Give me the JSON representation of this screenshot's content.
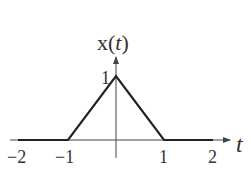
{
  "title": "x(t)",
  "title_parts": {
    "prefix": "x(",
    "var": "t",
    "suffix": ")"
  },
  "x_axis_label": "t",
  "x_ticks": [
    "−2",
    "−1",
    "1",
    "2"
  ],
  "y_ticks": [
    "1"
  ],
  "signal": {
    "description": "triangular pulse",
    "points": [
      [
        -2,
        0
      ],
      [
        -1,
        0
      ],
      [
        0,
        1
      ],
      [
        1,
        0
      ],
      [
        2,
        0
      ]
    ]
  },
  "colors": {
    "line": "#222222",
    "axis": "#444444",
    "text": "#333333"
  }
}
